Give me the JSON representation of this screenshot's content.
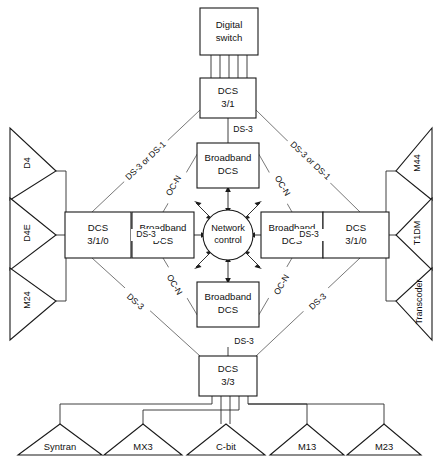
{
  "diagram": {
    "boxes": [
      {
        "id": "digital-switch",
        "line1": "Digital",
        "line2": "switch"
      },
      {
        "id": "dcs-31",
        "line1": "DCS",
        "line2": "3/1"
      },
      {
        "id": "broadband-dcs-top",
        "line1": "Broadband",
        "line2": "DCS"
      },
      {
        "id": "broadband-dcs-left",
        "line1": "Broadband",
        "line2": "DCS"
      },
      {
        "id": "broadband-dcs-right",
        "line1": "Broadband",
        "line2": "DCS"
      },
      {
        "id": "broadband-dcs-bottom",
        "line1": "Broadband",
        "line2": "DCS"
      },
      {
        "id": "dcs-310-left",
        "line1": "DCS",
        "line2": "3/1/0"
      },
      {
        "id": "dcs-310-right",
        "line1": "DCS",
        "line2": "3/1/0"
      },
      {
        "id": "dcs-33",
        "line1": "DCS",
        "line2": "3/3"
      }
    ],
    "center": {
      "id": "network-control",
      "line1": "Network",
      "line2": "control"
    },
    "left_terminals": [
      {
        "id": "d4",
        "label": "D4"
      },
      {
        "id": "d4e",
        "label": "D4E"
      },
      {
        "id": "m24",
        "label": "M24"
      }
    ],
    "right_terminals": [
      {
        "id": "m44",
        "label": "M44"
      },
      {
        "id": "t1dm",
        "label": "T1DM"
      },
      {
        "id": "transcoder",
        "label": "Transcoder"
      }
    ],
    "bottom_terminals": [
      {
        "id": "syntran",
        "label": "Syntran"
      },
      {
        "id": "mx3",
        "label": "MX3"
      },
      {
        "id": "c-bit",
        "label": "C-bit"
      },
      {
        "id": "m13",
        "label": "M13"
      },
      {
        "id": "m23",
        "label": "M23"
      }
    ],
    "edge_labels": {
      "top_center": "DS-3",
      "upper_left_outer": "DS-3 or DS-1",
      "upper_right_outer": "DS-3 or DS-1",
      "upper_left_inner": "OC-N",
      "upper_right_inner": "OC-N",
      "lower_left_inner": "OC-N",
      "lower_right_inner": "OC-N",
      "lower_left_outer": "DS-3",
      "lower_right_outer": "DS-3",
      "left_horizontal": "DS-3",
      "right_horizontal": "DS-3",
      "bottom_center": "DS-3"
    },
    "colors": {
      "stroke": "#1a1a1a",
      "background": "#ffffff",
      "text": "#111111"
    }
  }
}
